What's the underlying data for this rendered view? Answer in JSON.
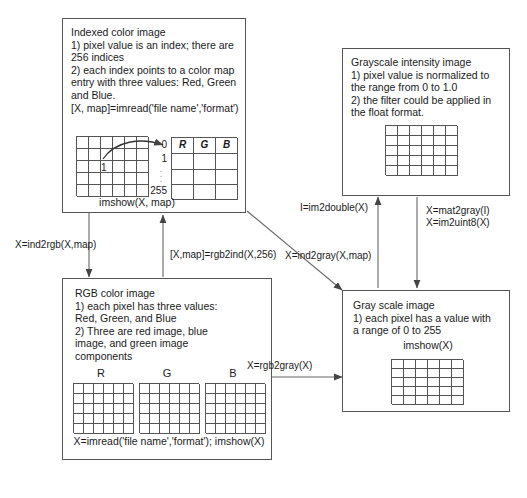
{
  "diagram": {
    "boxes": {
      "indexed": {
        "name": "Indexed color image",
        "body": "Indexed color image\n1) pixel value is an index; there are\n256 indices\n2) each index points to a color map\nentry with three values: Red, Green\nand Blue.\n[X, map]=imread('file name','format')",
        "cell_value": "1",
        "colormap_headers": [
          "R",
          "G",
          "B"
        ],
        "index_first": "0",
        "index_second": "1",
        "index_last": "255",
        "footer": "imshow(X, map)"
      },
      "grayscale_intensity": {
        "name": "Grayscale intensity image",
        "body": "Grayscale intensity image\n1) pixel value is normalized to\nthe range from 0 to 1.0\n2) the filter could be applied in\nthe float format."
      },
      "rgb": {
        "name": "RGB color image",
        "body": "RGB color image\n1) each pixel has three values:\nRed, Green, and Blue\n2) Three are red image, blue\nimage, and green image\ncomponents",
        "channel_labels": [
          "R",
          "G",
          "B"
        ],
        "footer": "X=imread('file name','format');\nimshow(X)"
      },
      "gray_scale": {
        "name": "Gray scale image",
        "body": "Gray scale image\n1) each pixel has a value with\na range of 0 to 255",
        "footer": "imshow(X)"
      }
    },
    "edges": {
      "ind2rgb": "X=ind2rgb(X,map)",
      "rgb2ind": "[X,map]=rgb2ind(X,256)",
      "ind2gray": "X=ind2gray(X,map)",
      "rgb2gray": "X=rgb2gray(X)",
      "im2double": "I=im2double(X)",
      "mat2gray": "X=mat2gray(I)\nX=im2uint8(X)"
    },
    "colors": {
      "stroke": "#555555",
      "text": "#1a1a1a",
      "background": "#ffffff"
    }
  }
}
